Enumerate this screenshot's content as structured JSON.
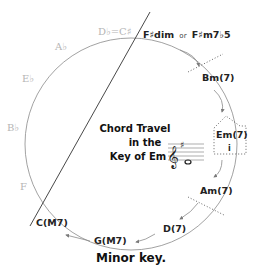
{
  "diagram": {
    "title_lines": [
      "Chord Travel",
      "in the",
      "Key of Em"
    ],
    "caption": "Minor key.",
    "ghost_notes": {
      "db_cs": "D♭=C♯",
      "ab": "A♭",
      "eb": "E♭",
      "bb": "B♭",
      "f": "F"
    },
    "chords": {
      "fsharp_dim": "F♯dim",
      "or_word": "or",
      "fsharp_m7b5": "F♯m7♭5",
      "bm7": "Bm(7)",
      "em7": "Em(7)",
      "em7_numeral": "i",
      "am7": "Am(7)",
      "d7": "D(7)",
      "gM7": "G(M7)",
      "cM7": "C(M7)"
    },
    "staff": {
      "clef": "treble",
      "key_signature": "♯",
      "note": "o"
    },
    "colors": {
      "line": "#8a8a8a",
      "ghost": "#b5b5b5",
      "text": "#222222",
      "arrow": "#8a8a8a"
    }
  }
}
